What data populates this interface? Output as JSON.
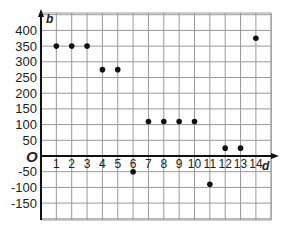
{
  "chart_data": {
    "type": "scatter",
    "title": "",
    "xlabel": "d",
    "ylabel": "b",
    "origin_label": "O",
    "x": [
      1,
      2,
      3,
      4,
      5,
      6,
      7,
      8,
      9,
      10,
      11,
      12,
      13,
      14
    ],
    "y": [
      350,
      350,
      350,
      275,
      275,
      -50,
      110,
      110,
      110,
      110,
      -90,
      25,
      25,
      375
    ],
    "xlim": [
      0,
      14.9
    ],
    "ylim": [
      -185,
      450
    ],
    "x_ticks": [
      1,
      2,
      3,
      4,
      5,
      6,
      7,
      8,
      9,
      10,
      11,
      12,
      13,
      14
    ],
    "y_ticks": [
      400,
      350,
      300,
      250,
      200,
      150,
      100,
      50,
      -50,
      -100,
      -150
    ],
    "grid": true,
    "legend": null,
    "point_color": "#111111",
    "grid_color": "#999999"
  }
}
